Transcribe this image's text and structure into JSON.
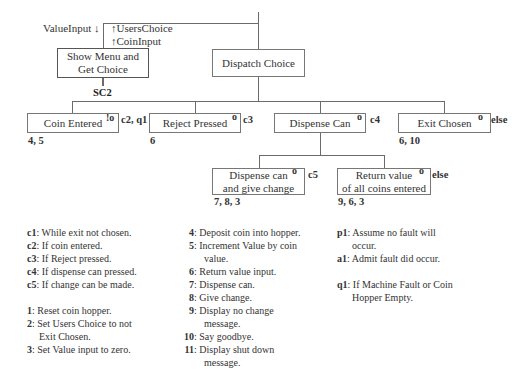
{
  "diagram": {
    "type": "Jackson structure chart",
    "data_flows": {
      "value_input": "ValueInput ↓",
      "users_choice": "↑UsersChoice",
      "coin_input": "↑CoinInput"
    },
    "top_level": {
      "show_menu": {
        "line1": "Show Menu and",
        "line2": "Get Choice",
        "label_below": "SC2"
      },
      "dispatch": {
        "label": "Dispatch Choice"
      }
    },
    "level2": [
      {
        "label": "Coin Entered",
        "marker": "!o",
        "condition": "c2, q1",
        "actions": "4, 5"
      },
      {
        "label": "Reject Pressed",
        "marker": "o",
        "condition": "c3",
        "actions": "6"
      },
      {
        "label": "Dispense Can",
        "marker": "o",
        "condition": "c4",
        "actions": ""
      },
      {
        "label": "Exit Chosen",
        "marker": "o",
        "condition": "else",
        "actions": "6, 10"
      }
    ],
    "level3": [
      {
        "line1": "Dispense can",
        "line2": "and give change",
        "marker": "o",
        "condition": "c5",
        "actions": "7, 8, 3"
      },
      {
        "line1": "Return value",
        "line2": "of all coins entered",
        "marker": "o",
        "condition": "else",
        "actions": "9, 6, 3"
      }
    ]
  },
  "legend": {
    "conditions": [
      {
        "key": "c1",
        "text": ": While exit not chosen."
      },
      {
        "key": "c2",
        "text": ": If coin entered."
      },
      {
        "key": "c3",
        "text": ": If Reject pressed."
      },
      {
        "key": "c4",
        "text": ": If dispense can pressed."
      },
      {
        "key": "c5",
        "text": ": If change can be made."
      }
    ],
    "actions_a": [
      {
        "key": "1",
        "text": ": Reset coin hopper."
      },
      {
        "key": "2",
        "text": ": Set Users Choice to not",
        "cont": "Exit Chosen."
      },
      {
        "key": "3",
        "text": ": Set Value input to zero."
      }
    ],
    "actions_b": [
      {
        "key": "4",
        "text": ": Deposit coin into hopper."
      },
      {
        "key": "5",
        "text": ": Increment Value by coin",
        "cont": "value."
      },
      {
        "key": "6",
        "text": ": Return value input."
      },
      {
        "key": "7",
        "text": ": Dispense can."
      },
      {
        "key": "8",
        "text": ": Give change."
      },
      {
        "key": "9",
        "text": ": Display no change",
        "cont": "message."
      },
      {
        "key": "10",
        "text": ": Say goodbye."
      },
      {
        "key": "11",
        "text": ": Display shut down",
        "cont": "message."
      }
    ],
    "posit": [
      {
        "key": "p1",
        "text": ": Assume no fault will",
        "cont": "occur."
      },
      {
        "key": "a1",
        "text": ": Admit fault did occur."
      }
    ],
    "quit": [
      {
        "key": "q1",
        "text": ": If Machine Fault or Coin",
        "cont": "Hopper Empty."
      }
    ]
  }
}
